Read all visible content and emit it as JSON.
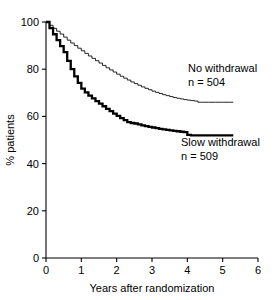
{
  "chart_data": {
    "type": "line",
    "title": "",
    "subtitle": "",
    "xlabel": "Years after randomization",
    "ylabel": "% patients",
    "xlim": [
      0,
      6
    ],
    "ylim": [
      0,
      100
    ],
    "xticks": [
      "0",
      "1",
      "2",
      "3",
      "4",
      "5",
      "6"
    ],
    "yticks": [
      "0",
      "20",
      "40",
      "60",
      "80",
      "100"
    ],
    "xtick_values": [
      0,
      1,
      2,
      3,
      4,
      5,
      6
    ],
    "ytick_values": [
      0,
      20,
      40,
      60,
      80,
      100
    ],
    "grid": false,
    "legend_position": "inline-annotation",
    "series": [
      {
        "name": "No withdrawal",
        "n_label": "n = 504",
        "n": 504,
        "style": "thin",
        "color": "#000000",
        "final_value": 66,
        "x": [
          0.0,
          0.1,
          0.2,
          0.3,
          0.4,
          0.5,
          0.6,
          0.7,
          0.8,
          0.9,
          1.0,
          1.1,
          1.2,
          1.3,
          1.4,
          1.5,
          1.6,
          1.7,
          1.8,
          1.9,
          2.0,
          2.1,
          2.2,
          2.3,
          2.4,
          2.5,
          2.6,
          2.7,
          2.8,
          2.9,
          3.0,
          3.1,
          3.2,
          3.3,
          3.4,
          3.5,
          3.6,
          3.7,
          3.8,
          3.9,
          4.0,
          4.1,
          4.2,
          4.3,
          4.4,
          4.6,
          4.8,
          5.0,
          5.2,
          5.3
        ],
        "y": [
          100.0,
          98.6,
          97.3,
          96.1,
          94.9,
          93.6,
          92.3,
          91.1,
          90.0,
          88.9,
          87.8,
          86.7,
          85.6,
          84.6,
          83.6,
          82.6,
          81.6,
          80.6,
          79.7,
          78.8,
          77.9,
          77.0,
          76.2,
          75.4,
          74.6,
          73.9,
          73.2,
          72.5,
          71.9,
          71.3,
          70.7,
          70.2,
          69.7,
          69.2,
          68.8,
          68.4,
          68.0,
          67.7,
          67.4,
          67.1,
          66.9,
          66.7,
          66.5,
          66.0,
          66.0,
          66.0,
          66.0,
          66.0,
          66.0,
          66.0
        ]
      },
      {
        "name": "Slow withdrawal",
        "n_label": "n = 509",
        "n": 509,
        "style": "thick",
        "color": "#000000",
        "final_value": 52,
        "x": [
          0.0,
          0.1,
          0.2,
          0.3,
          0.4,
          0.5,
          0.6,
          0.7,
          0.8,
          0.9,
          1.0,
          1.1,
          1.2,
          1.3,
          1.4,
          1.5,
          1.6,
          1.7,
          1.8,
          1.9,
          2.0,
          2.1,
          2.2,
          2.3,
          2.4,
          2.5,
          2.6,
          2.7,
          2.8,
          2.9,
          3.0,
          3.1,
          3.2,
          3.3,
          3.4,
          3.5,
          3.6,
          3.7,
          3.8,
          3.9,
          4.0,
          4.1,
          4.2,
          4.4,
          4.6,
          4.8,
          5.0,
          5.2,
          5.3
        ],
        "y": [
          100.0,
          97.4,
          94.8,
          92.3,
          89.8,
          87.2,
          83.5,
          80.0,
          77.0,
          74.2,
          71.8,
          70.2,
          68.8,
          67.6,
          66.5,
          65.4,
          64.3,
          63.2,
          62.2,
          61.2,
          60.2,
          59.3,
          58.4,
          57.6,
          57.2,
          57.0,
          56.6,
          56.2,
          55.9,
          55.6,
          55.3,
          55.0,
          54.7,
          54.5,
          54.3,
          54.1,
          53.9,
          53.7,
          53.5,
          53.3,
          52.2,
          52.0,
          52.0,
          52.0,
          52.0,
          52.0,
          52.0,
          52.0,
          52.0
        ]
      }
    ],
    "annotations": [
      {
        "id": "no-withdrawal-label",
        "line1": "No withdrawal",
        "line2": "n = 504"
      },
      {
        "id": "slow-withdrawal-label",
        "line1": "Slow withdrawal",
        "line2": "n = 509"
      }
    ]
  }
}
